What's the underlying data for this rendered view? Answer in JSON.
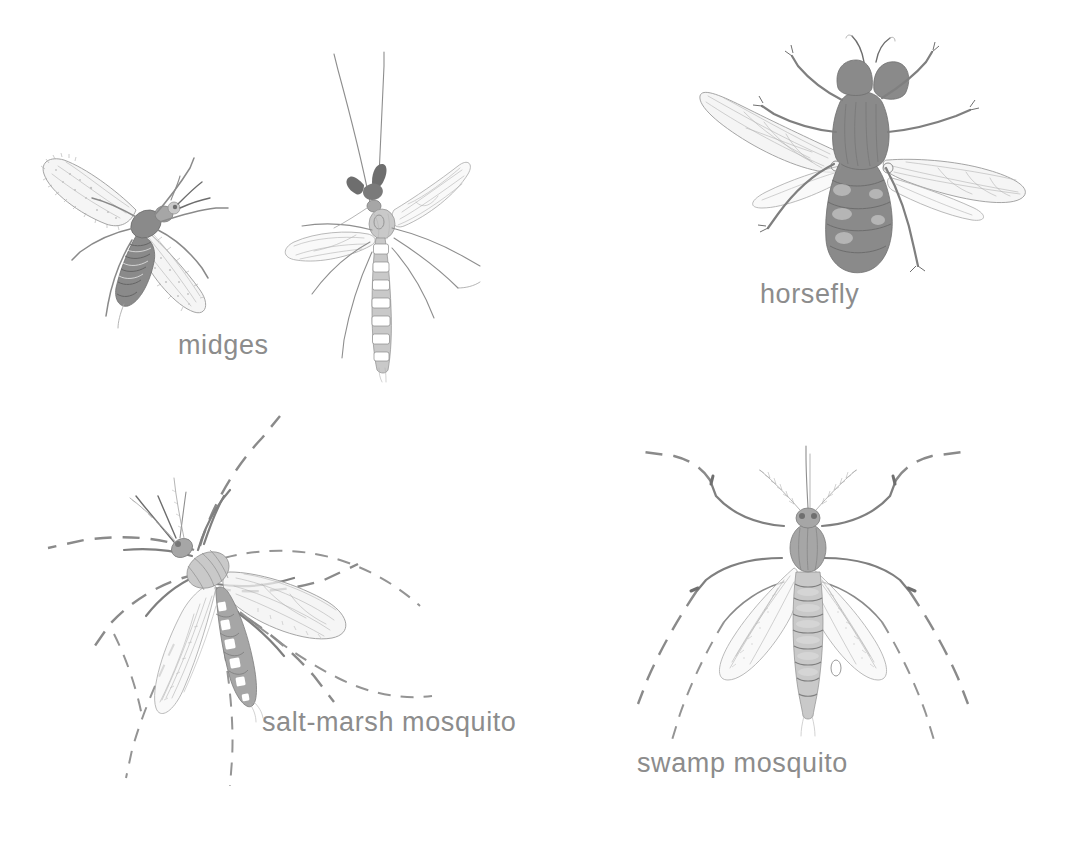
{
  "plate": {
    "background_color": "#ffffff",
    "ink_color": "#8e8e8e",
    "caption_color": "#8c8c8c",
    "style": "pencil / engraving natural-history illustration plate",
    "subject": "biting flies and mosquitoes"
  },
  "figures": [
    {
      "id": "midges",
      "caption": "midges",
      "count": 2,
      "notes": "two midges: a hairy-winged biting midge at upper left and a slender long-legged midge with plumose antennae and banded abdomen"
    },
    {
      "id": "horsefly",
      "caption": "horsefly",
      "count": 1,
      "notes": "stout dark-bodied fly in dorsal view with large compound eyes, two pairs of veined wings spread, six bristly legs"
    },
    {
      "id": "salt-marsh-mosquito",
      "caption": "salt-marsh mosquito",
      "count": 1,
      "notes": "three-quarter view mosquito with white-banded abdomen, long dashed legs sweeping outward, two veined wings"
    },
    {
      "id": "swamp-mosquito",
      "caption": "swamp mosquito",
      "count": 1,
      "notes": "symmetric dorsal view mosquito with segmented abdomen, hairy wings, long dashed legs angled outward"
    }
  ],
  "captions": {
    "midges": "midges",
    "horsefly": "horsefly",
    "salt_marsh_mosquito": "salt-marsh mosquito",
    "swamp_mosquito": "swamp mosquito"
  }
}
